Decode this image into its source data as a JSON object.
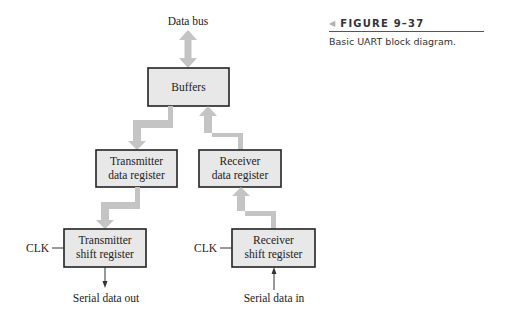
{
  "figure": {
    "number": "FIGURE 9–37",
    "caption": "Basic UART block diagram."
  },
  "diagram": {
    "top_label": "Data bus",
    "blocks": {
      "buffers": {
        "lines": [
          "Buffers"
        ]
      },
      "tx_data_register": {
        "lines": [
          "Transmitter",
          "data register"
        ]
      },
      "rx_data_register": {
        "lines": [
          "Receiver",
          "data register"
        ]
      },
      "tx_shift_register": {
        "lines": [
          "Transmitter",
          "shift register"
        ]
      },
      "rx_shift_register": {
        "lines": [
          "Receiver",
          "shift register"
        ]
      }
    },
    "signals": {
      "tx_clk": "CLK",
      "rx_clk": "CLK",
      "serial_out": "Serial data out",
      "serial_in": "Serial data in"
    },
    "colors": {
      "block_fill": "#e8e8e8",
      "block_stroke": "#222222",
      "bus_arrow": "#c4c4c4"
    }
  }
}
